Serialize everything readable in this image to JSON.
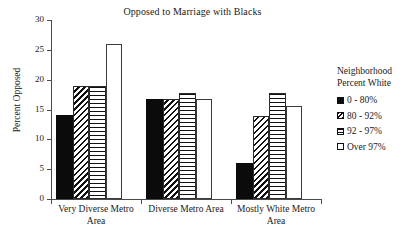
{
  "chart_data": {
    "type": "bar",
    "title": "Opposed to Marriage with Blacks",
    "xlabel": "",
    "ylabel": "Percent Opposed",
    "ylim": [
      0,
      30
    ],
    "yticks": [
      0,
      5,
      10,
      15,
      20,
      25,
      30
    ],
    "ytick_labels": [
      "0",
      "5",
      "10",
      "15",
      "20",
      "25",
      "30"
    ],
    "grid": false,
    "legend_position": "right",
    "legend_title_lines": [
      "Neighborhood",
      "Percent White"
    ],
    "categories": [
      "Very Diverse Metro Area",
      "Diverse Metro Area",
      "Mostly White Metro Area"
    ],
    "category_label_lines": [
      [
        "Very Diverse Metro",
        "Area"
      ],
      [
        "Diverse Metro Area"
      ],
      [
        "Mostly White Metro",
        "Area"
      ]
    ],
    "series": [
      {
        "name": "0 - 80%",
        "pattern": "solid-black",
        "values": [
          14.0,
          16.8,
          6.0
        ]
      },
      {
        "name": "80 - 92%",
        "pattern": "diag-hatch",
        "values": [
          19.0,
          16.8,
          13.9
        ]
      },
      {
        "name": "92 - 97%",
        "pattern": "horiz-stripe",
        "values": [
          19.0,
          17.8,
          17.7
        ]
      },
      {
        "name": "Over 97%",
        "pattern": "open-white",
        "values": [
          26.0,
          16.8,
          15.6
        ]
      }
    ]
  },
  "colors": {
    "axis": "#4a4a4a",
    "ink": "#1a1a1a",
    "bar_fill_dark": "#0b0b0b",
    "bar_fill_light": "#ffffff"
  }
}
